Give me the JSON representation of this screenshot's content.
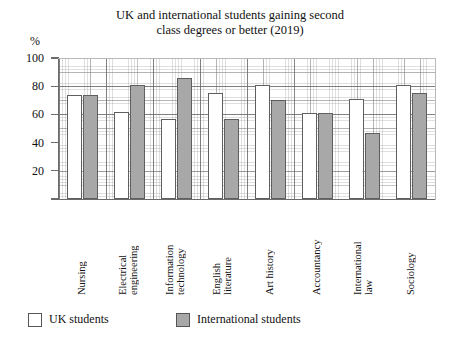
{
  "chart_data": {
    "type": "bar",
    "title": "UK and international students gaining second class degrees or better (2019)",
    "title_line1": "UK and international students gaining second",
    "title_line2": "class degrees or better (2019)",
    "unit_label": "%",
    "xlabel": "",
    "ylabel": "%",
    "ylim": [
      0,
      100
    ],
    "yticks": [
      0,
      20,
      40,
      60,
      80,
      100
    ],
    "ytick_labels": [
      "20",
      "40",
      "60",
      "80",
      "100"
    ],
    "grid": true,
    "legend_position": "bottom",
    "categories": [
      "Nursing",
      "Electrical engineering",
      "Information technology",
      "English literature",
      "Art history",
      "Accountancy",
      "International law",
      "Sociology"
    ],
    "category_lines": [
      [
        "Nursing"
      ],
      [
        "Electrical",
        "engineering"
      ],
      [
        "Information",
        "technology"
      ],
      [
        "English",
        "literature"
      ],
      [
        "Art history"
      ],
      [
        "Accountancy"
      ],
      [
        "International",
        "law"
      ],
      [
        "Sociology"
      ]
    ],
    "series": [
      {
        "name": "UK students",
        "color": "#ffffff",
        "values": [
          74,
          62,
          57,
          75,
          81,
          61,
          71,
          81
        ]
      },
      {
        "name": "International students",
        "color": "#a8a8a8",
        "values": [
          74,
          81,
          86,
          57,
          70,
          61,
          47,
          75
        ]
      }
    ]
  },
  "legend": {
    "items": [
      {
        "label": "UK students",
        "swatch": "uk"
      },
      {
        "label": "International students",
        "swatch": "intl"
      }
    ]
  }
}
